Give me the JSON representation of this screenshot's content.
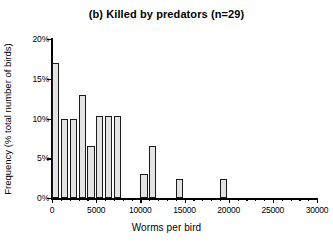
{
  "chart_data": {
    "type": "bar",
    "title": "(b) Killed by predators (n=29)",
    "xlabel": "Worms per bird",
    "ylabel": "Frequency (% total number of birds)",
    "xlim": [
      0,
      30000
    ],
    "ylim": [
      0,
      20
    ],
    "grid": false,
    "legend": null,
    "bin_width": 1000,
    "x_major_ticks": [
      0,
      5000,
      10000,
      15000,
      20000,
      25000,
      30000
    ],
    "x_tick_labels": [
      "0",
      "5000",
      "10000",
      "15000",
      "20000",
      "25000",
      "30000"
    ],
    "x_minor_tick_interval": 1000,
    "y_major_ticks": [
      0,
      5,
      10,
      15,
      20
    ],
    "y_tick_labels": [
      "0%",
      "5%",
      "10%",
      "15%",
      "20%"
    ],
    "categories": [
      "0-1000",
      "1000-2000",
      "2000-3000",
      "3000-4000",
      "4000-5000",
      "5000-6000",
      "6000-7000",
      "7000-8000",
      "10000-11000",
      "11000-12000",
      "14000-15000",
      "19000-20000"
    ],
    "bins": [
      {
        "start": 0,
        "end": 1000,
        "value": 17.0
      },
      {
        "start": 1000,
        "end": 2000,
        "value": 10.0
      },
      {
        "start": 2000,
        "end": 3000,
        "value": 10.0
      },
      {
        "start": 3000,
        "end": 4000,
        "value": 13.0
      },
      {
        "start": 4000,
        "end": 5000,
        "value": 6.5
      },
      {
        "start": 5000,
        "end": 6000,
        "value": 10.3
      },
      {
        "start": 6000,
        "end": 7000,
        "value": 10.3
      },
      {
        "start": 7000,
        "end": 8000,
        "value": 10.3
      },
      {
        "start": 10000,
        "end": 11000,
        "value": 3.0
      },
      {
        "start": 11000,
        "end": 12000,
        "value": 6.5
      },
      {
        "start": 14000,
        "end": 15000,
        "value": 2.4
      },
      {
        "start": 19000,
        "end": 20000,
        "value": 2.4
      }
    ],
    "values": [
      17.0,
      10.0,
      10.0,
      13.0,
      6.5,
      10.3,
      10.3,
      10.3,
      3.0,
      6.5,
      2.4,
      2.4
    ],
    "bar_fill_color": "#e3e3e3",
    "bar_edge_color": "#1a1a1a",
    "background_color": "#ffffff"
  }
}
